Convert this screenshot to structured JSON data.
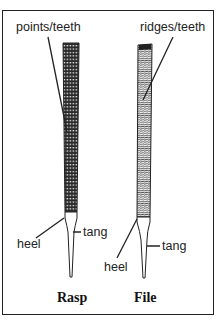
{
  "diagram": {
    "tools": [
      {
        "name": "Rasp",
        "labels": {
          "top": "points/teeth",
          "heel": "heel",
          "tang": "tang"
        }
      },
      {
        "name": "File",
        "labels": {
          "top": "ridges/teeth",
          "heel": "heel",
          "tang": "tang"
        }
      }
    ],
    "colors": {
      "ink": "#222222",
      "background": "#ffffff"
    }
  }
}
